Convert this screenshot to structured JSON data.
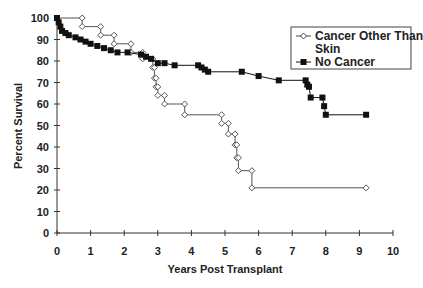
{
  "chart_data": {
    "type": "line",
    "subtype": "kaplan-meier step",
    "title": "",
    "xlabel": "Years Post Transplant",
    "ylabel": "Percent Survival",
    "xlim": [
      0,
      10
    ],
    "ylim": [
      0,
      100
    ],
    "xticks": [
      0,
      1,
      2,
      3,
      4,
      5,
      6,
      7,
      8,
      9,
      10
    ],
    "yticks": [
      0,
      10,
      20,
      30,
      40,
      50,
      60,
      70,
      80,
      90,
      100
    ],
    "grid": false,
    "legend_position": "upper right",
    "series": [
      {
        "name": "Cancer Other Than Skin",
        "marker": "open-diamond",
        "color": "#555555",
        "points": [
          [
            0,
            100
          ],
          [
            0.75,
            100
          ],
          [
            0.75,
            96
          ],
          [
            1.3,
            96
          ],
          [
            1.3,
            92
          ],
          [
            1.7,
            92
          ],
          [
            1.7,
            88
          ],
          [
            2.2,
            88
          ],
          [
            2.2,
            84
          ],
          [
            2.55,
            84
          ],
          [
            2.55,
            81
          ],
          [
            2.85,
            81
          ],
          [
            2.85,
            77
          ],
          [
            2.9,
            77
          ],
          [
            2.9,
            72
          ],
          [
            2.95,
            72
          ],
          [
            2.95,
            68
          ],
          [
            3.0,
            68
          ],
          [
            3.0,
            64
          ],
          [
            3.2,
            64
          ],
          [
            3.2,
            60
          ],
          [
            3.8,
            60
          ],
          [
            3.8,
            55
          ],
          [
            4.9,
            55
          ],
          [
            4.9,
            51
          ],
          [
            5.1,
            51
          ],
          [
            5.1,
            46
          ],
          [
            5.3,
            46
          ],
          [
            5.3,
            41
          ],
          [
            5.35,
            41
          ],
          [
            5.35,
            35
          ],
          [
            5.4,
            35
          ],
          [
            5.4,
            29
          ],
          [
            5.8,
            29
          ],
          [
            5.8,
            21
          ],
          [
            9.2,
            21
          ]
        ]
      },
      {
        "name": "No Cancer",
        "marker": "filled-square",
        "color": "#111111",
        "points": [
          [
            0,
            100
          ],
          [
            0.05,
            98
          ],
          [
            0.1,
            96
          ],
          [
            0.15,
            94
          ],
          [
            0.25,
            93
          ],
          [
            0.35,
            92
          ],
          [
            0.55,
            91
          ],
          [
            0.7,
            90
          ],
          [
            0.85,
            89
          ],
          [
            1.0,
            88
          ],
          [
            1.2,
            87
          ],
          [
            1.4,
            86
          ],
          [
            1.6,
            85
          ],
          [
            1.8,
            84
          ],
          [
            2.1,
            84
          ],
          [
            2.5,
            83
          ],
          [
            2.65,
            82
          ],
          [
            2.8,
            81
          ],
          [
            3.0,
            79
          ],
          [
            3.2,
            79
          ],
          [
            3.5,
            78
          ],
          [
            4.2,
            78
          ],
          [
            4.3,
            77
          ],
          [
            4.4,
            76
          ],
          [
            4.5,
            75
          ],
          [
            5.5,
            75
          ],
          [
            6.0,
            73
          ],
          [
            6.6,
            71
          ],
          [
            7.4,
            71
          ],
          [
            7.45,
            69
          ],
          [
            7.5,
            68
          ],
          [
            7.55,
            63
          ],
          [
            7.9,
            63
          ],
          [
            7.95,
            59
          ],
          [
            8.0,
            55
          ],
          [
            9.2,
            55
          ]
        ]
      }
    ]
  },
  "legend": {
    "items": [
      {
        "line1": "Cancer Other Than",
        "line2": "Skin",
        "marker": "open-diamond"
      },
      {
        "line1": "No Cancer",
        "line2": "",
        "marker": "filled-square"
      }
    ]
  }
}
